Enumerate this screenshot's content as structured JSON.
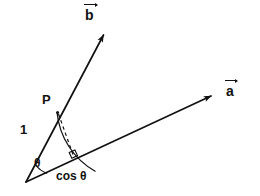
{
  "figure": {
    "background_color": "#ffffff",
    "stroke_color": "#111111",
    "width": 260,
    "height": 196
  },
  "labels": {
    "vector_b": "b",
    "vector_a": "a",
    "point_p": "P",
    "unit_length": "1",
    "angle_theta": "θ",
    "projection_length": "cos θ"
  },
  "geometry": {
    "origin": {
      "x": 26,
      "y": 182
    },
    "vector_a_tip": {
      "x": 215,
      "y": 94
    },
    "vector_b_tip": {
      "x": 106,
      "y": 31
    },
    "point_p": {
      "x": 57,
      "y": 112
    },
    "projection_foot": {
      "x": 73,
      "y": 157
    },
    "unit_radius": 76,
    "theta_arc_radius": 22,
    "right_angle_marker_size": 6
  },
  "elements": {
    "vector_a_name": "vector-a",
    "vector_b_name": "vector-b",
    "dashed_perpendicular_name": "perpendicular-dashed-line",
    "unit_arc_name": "unit-radius-arc",
    "theta_arc_name": "theta-angle-arc",
    "right_angle_name": "right-angle-marker"
  }
}
